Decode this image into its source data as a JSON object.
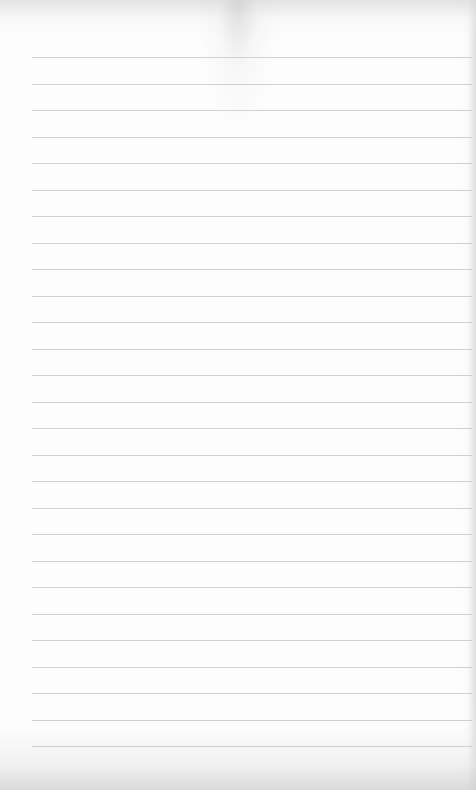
{
  "page": {
    "type": "blank-lined-paper",
    "background_color": "#fdfdfd",
    "line_color": "#c9c9c9",
    "line_count": 27,
    "first_line_y": 57,
    "line_spacing": 26.5,
    "line_left_margin": 32,
    "text_content": ""
  }
}
